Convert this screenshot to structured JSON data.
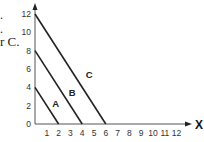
{
  "text_fragments": [
    ".",
    ".",
    "r C."
  ],
  "chart_data": {
    "type": "line",
    "title": "",
    "xlabel": "X",
    "ylabel": "",
    "xlim": [
      0,
      12
    ],
    "ylim": [
      0,
      12
    ],
    "x_ticks": [
      "1",
      "2",
      "3",
      "4",
      "5",
      "6",
      "7",
      "8",
      "9",
      "10",
      "11",
      "12"
    ],
    "y_ticks": [
      "0",
      "2",
      "4",
      "6",
      "8",
      "10",
      "12"
    ],
    "grid": false,
    "legend": "inline labels",
    "series": [
      {
        "name": "A",
        "points": [
          [
            0,
            4
          ],
          [
            2,
            0
          ]
        ],
        "label_at": [
          1.75,
          2.2
        ]
      },
      {
        "name": "B",
        "points": [
          [
            0,
            8
          ],
          [
            4,
            0
          ]
        ],
        "label_at": [
          3.15,
          3.4
        ]
      },
      {
        "name": "C",
        "points": [
          [
            0,
            12
          ],
          [
            6,
            0
          ]
        ],
        "label_at": [
          4.6,
          5.3
        ]
      }
    ],
    "line_color": "#222222"
  }
}
